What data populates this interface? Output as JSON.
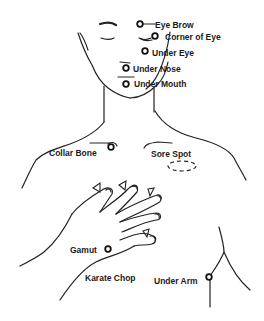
{
  "points": {
    "eye_brow": "Eye Brow",
    "corner_of_eye": "Corner of Eye",
    "under_eye": "Under Eye",
    "under_nose": "Under Nose",
    "under_mouth": "Under Mouth",
    "collar_bone": "Collar Bone",
    "sore_spot": "Sore Spot",
    "gamut": "Gamut",
    "karate_chop": "Karate Chop",
    "under_arm": "Under Arm"
  },
  "colors": {
    "ink": "#222222",
    "background": "#ffffff"
  }
}
